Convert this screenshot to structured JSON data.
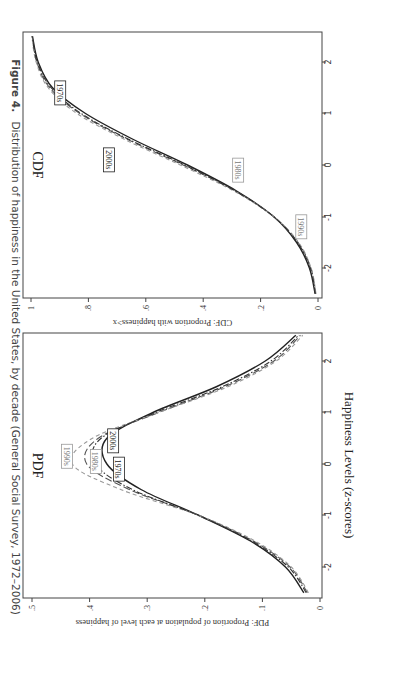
{
  "figure": {
    "caption_label": "Figure 4.",
    "caption_text": "Distribution of happiness in the United States, by decade (General Social Survey, 1972–2006)",
    "shared_xlabel": "Happiness Levels (z-scores)"
  },
  "chart_data": [
    {
      "type": "line",
      "title": "PDF",
      "xlabel": "Happiness Levels (z-scores)",
      "ylabel": "PDF: Proportion of population at each level of happiness",
      "xlim": [
        -2.5,
        2.5
      ],
      "ylim": [
        0,
        0.5
      ],
      "xticks": [
        "-2",
        "-1",
        "0",
        "1",
        "2"
      ],
      "yticks": [
        "0",
        ".1",
        ".2",
        ".3",
        ".4",
        ".5"
      ],
      "grid": false,
      "x": [
        -2.5,
        -2.0,
        -1.5,
        -1.0,
        -0.5,
        0.0,
        0.5,
        1.0,
        1.5,
        2.0,
        2.5
      ],
      "series": [
        {
          "name": "1970s",
          "style": "solid",
          "values": [
            0.028,
            0.06,
            0.12,
            0.21,
            0.31,
            0.37,
            0.37,
            0.29,
            0.18,
            0.095,
            0.042
          ]
        },
        {
          "name": "1980s",
          "style": "longdash",
          "values": [
            0.022,
            0.052,
            0.115,
            0.21,
            0.33,
            0.405,
            0.385,
            0.28,
            0.165,
            0.08,
            0.034
          ]
        },
        {
          "name": "1990s",
          "style": "dash",
          "values": [
            0.02,
            0.05,
            0.112,
            0.21,
            0.345,
            0.43,
            0.395,
            0.28,
            0.16,
            0.076,
            0.03
          ]
        },
        {
          "name": "2000s",
          "style": "dashdot",
          "values": [
            0.024,
            0.055,
            0.118,
            0.21,
            0.325,
            0.39,
            0.38,
            0.285,
            0.17,
            0.085,
            0.037
          ]
        }
      ],
      "labels": [
        {
          "text": "1990s",
          "x": 0.15,
          "y": 0.44
        },
        {
          "text": "1980s",
          "x": 0.05,
          "y": 0.39
        },
        {
          "text": "1970s",
          "x": -0.1,
          "y": 0.35
        },
        {
          "text": "2000s",
          "x": 0.45,
          "y": 0.36
        }
      ]
    },
    {
      "type": "line",
      "title": "CDF",
      "xlabel": "Happiness Levels (z-scores)",
      "ylabel": "CDF: Proportion with happiness>x",
      "xlim": [
        -2.5,
        2.5
      ],
      "ylim": [
        0,
        1
      ],
      "xticks": [
        "-2",
        "-1",
        "0",
        "1",
        "2"
      ],
      "yticks": [
        "0",
        ".2",
        ".4",
        ".6",
        ".8",
        "1"
      ],
      "grid": false,
      "x": [
        -2.5,
        -2.0,
        -1.5,
        -1.0,
        -0.5,
        0.0,
        0.5,
        1.0,
        1.5,
        2.0,
        2.5
      ],
      "series": [
        {
          "name": "1970s",
          "style": "solid",
          "values": [
            0.01,
            0.03,
            0.075,
            0.155,
            0.285,
            0.455,
            0.645,
            0.81,
            0.925,
            0.975,
            0.995
          ]
        },
        {
          "name": "1980s",
          "style": "longdash",
          "values": [
            0.008,
            0.025,
            0.07,
            0.155,
            0.29,
            0.47,
            0.665,
            0.83,
            0.935,
            0.98,
            0.996
          ]
        },
        {
          "name": "1990s",
          "style": "dash",
          "values": [
            0.007,
            0.024,
            0.068,
            0.155,
            0.295,
            0.48,
            0.675,
            0.84,
            0.94,
            0.982,
            0.997
          ]
        },
        {
          "name": "2000s",
          "style": "dashdot",
          "values": [
            0.009,
            0.027,
            0.072,
            0.155,
            0.29,
            0.465,
            0.66,
            0.825,
            0.93,
            0.978,
            0.996
          ]
        }
      ],
      "labels": [
        {
          "text": "1970s",
          "x": 1.4,
          "y": 0.9
        },
        {
          "text": "2000s",
          "x": 0.1,
          "y": 0.73
        },
        {
          "text": "1980s",
          "x": -0.1,
          "y": 0.28
        },
        {
          "text": "1990s",
          "x": -1.2,
          "y": 0.06
        }
      ]
    }
  ]
}
